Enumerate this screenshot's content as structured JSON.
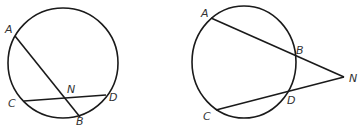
{
  "figures": [
    {
      "name": "intersecting-chords",
      "circle": {
        "cx": 63,
        "cy": 63,
        "rx": 55,
        "ry": 55
      },
      "points": {
        "A": {
          "x": 15,
          "y": 36
        },
        "B": {
          "x": 80,
          "y": 117
        },
        "C": {
          "x": 24,
          "y": 101
        },
        "D": {
          "x": 106,
          "y": 95
        },
        "N": {
          "x": 66,
          "y": 98
        }
      },
      "segments": [
        [
          "A",
          "B"
        ],
        [
          "C",
          "D"
        ]
      ],
      "labels": {
        "A": {
          "text": "A",
          "x": 5,
          "y": 33
        },
        "B": {
          "text": "B",
          "x": 76,
          "y": 125
        },
        "C": {
          "text": "C",
          "x": 8,
          "y": 107
        },
        "D": {
          "text": "D",
          "x": 109,
          "y": 101
        },
        "N": {
          "text": "N",
          "x": 67,
          "y": 93
        }
      }
    },
    {
      "name": "intersecting-secants",
      "circle": {
        "cx": 244,
        "cy": 62,
        "rx": 52,
        "ry": 56
      },
      "points": {
        "A": {
          "x": 211,
          "y": 18
        },
        "B": {
          "x": 296,
          "y": 56
        },
        "C": {
          "x": 216,
          "y": 110
        },
        "D": {
          "x": 288,
          "y": 91
        },
        "N": {
          "x": 344,
          "y": 77
        }
      },
      "segments": [
        [
          "A",
          "N"
        ],
        [
          "C",
          "N"
        ]
      ],
      "labels": {
        "A": {
          "text": "A",
          "x": 201,
          "y": 17
        },
        "B": {
          "text": "B",
          "x": 296,
          "y": 54
        },
        "C": {
          "text": "C",
          "x": 203,
          "y": 120
        },
        "D": {
          "text": "D",
          "x": 287,
          "y": 104
        },
        "N": {
          "text": "N",
          "x": 349,
          "y": 82
        }
      }
    }
  ]
}
